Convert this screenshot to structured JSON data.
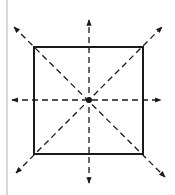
{
  "diagram": {
    "background": "#ffffff",
    "stroke_color": "#1a1a1a",
    "margin_line": {
      "x": 7,
      "y1": 0,
      "y2": 195,
      "color": "#b0b0b0"
    },
    "square": {
      "x": 34,
      "y": 47,
      "width": 109,
      "height": 107,
      "stroke_width": 2
    },
    "center": {
      "x": 89,
      "y": 100,
      "radius": 3
    },
    "axes": [
      {
        "name": "vertical-axis",
        "x1": 89,
        "y1": 183,
        "x2": 89,
        "y2": 20,
        "arrows": "both"
      },
      {
        "name": "horizontal-axis",
        "x1": 12,
        "y1": 100,
        "x2": 161,
        "y2": 100,
        "arrows": "both"
      },
      {
        "name": "diagonal-axis-main",
        "x1": 14,
        "y1": 27,
        "x2": 165,
        "y2": 177,
        "arrows": "both"
      },
      {
        "name": "diagonal-axis-anti",
        "x1": 16,
        "y1": 173,
        "x2": 162,
        "y2": 27,
        "arrows": "both"
      }
    ],
    "dash_pattern": "6 4",
    "axis_stroke_width": 1.3
  }
}
